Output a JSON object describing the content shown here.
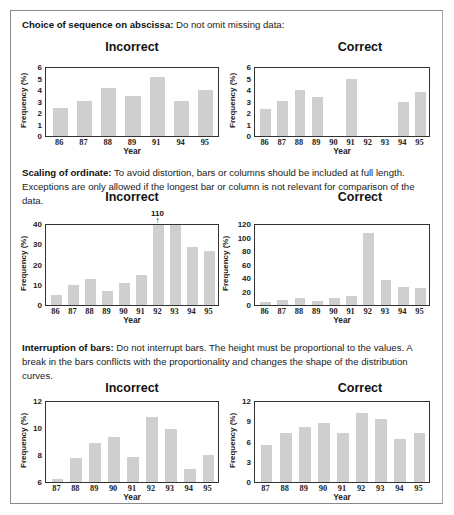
{
  "sections": [
    {
      "heading": "Choice of sequence on abscissa:",
      "text": "Do not omit missing data:"
    },
    {
      "heading": "Scaling of ordinate:",
      "text": "To avoid distortion, bars or columns should be included at full length. Exceptions are only allowed if the longest bar or column is not relevant for comparison of the data."
    },
    {
      "heading": "Interruption of bars:",
      "text": "Do not interrupt bars. The height must be proportional to the values. A break in the bars conflicts with the proportionality and changes the shape of the distribution curves."
    }
  ],
  "labels": {
    "incorrect": "Incorrect",
    "correct": "Correct",
    "xlabel": "Year",
    "ylabel": "Frequency (%)",
    "annotation_110": "110",
    "annotation_arrow": "↑"
  },
  "chart_data": [
    {
      "id": "abscissa-incorrect",
      "type": "bar",
      "title": "Incorrect",
      "xlabel": "Year",
      "ylabel": "Frequency (%)",
      "categories": [
        "86",
        "87",
        "88",
        "89",
        "91",
        "94",
        "95"
      ],
      "values": [
        2.5,
        3.1,
        4.2,
        3.5,
        5.2,
        3.1,
        4.1
      ],
      "ylim": [
        0,
        6
      ],
      "yticks": [
        "0",
        "1",
        "2",
        "3",
        "4",
        "5",
        "6"
      ],
      "grid": false
    },
    {
      "id": "abscissa-correct",
      "type": "bar",
      "title": "Correct",
      "xlabel": "Year",
      "ylabel": "Frequency (%)",
      "categories": [
        "86",
        "87",
        "88",
        "89",
        "90",
        "91",
        "92",
        "93",
        "94",
        "95"
      ],
      "values": [
        2.4,
        3.1,
        4.1,
        3.4,
        null,
        5.0,
        null,
        null,
        3.0,
        3.9
      ],
      "ylim": [
        0,
        6
      ],
      "yticks": [
        "0",
        "1",
        "2",
        "3",
        "4",
        "5",
        "6"
      ],
      "grid": false
    },
    {
      "id": "ordinate-incorrect",
      "type": "bar",
      "title": "Incorrect",
      "xlabel": "Year",
      "ylabel": "Frequency (%)",
      "categories": [
        "86",
        "87",
        "88",
        "89",
        "90",
        "91",
        "92",
        "93",
        "94",
        "95"
      ],
      "values": [
        5,
        10,
        13,
        7,
        11,
        15,
        110,
        40,
        29,
        27
      ],
      "ylim": [
        0,
        40
      ],
      "yticks": [
        "0",
        "10",
        "20",
        "30",
        "40"
      ],
      "annotations": [
        {
          "category": "92",
          "text": "110",
          "arrow": "up"
        }
      ],
      "grid": false
    },
    {
      "id": "ordinate-correct",
      "type": "bar",
      "title": "Correct",
      "xlabel": "Year",
      "ylabel": "Frequency (%)",
      "categories": [
        "86",
        "87",
        "88",
        "89",
        "90",
        "91",
        "92",
        "93",
        "94",
        "95"
      ],
      "values": [
        4,
        8,
        11,
        6,
        10,
        14,
        108,
        38,
        27,
        25
      ],
      "ylim": [
        0,
        120
      ],
      "yticks": [
        "0",
        "20",
        "40",
        "60",
        "80",
        "100",
        "120"
      ],
      "grid": false
    },
    {
      "id": "interruption-incorrect",
      "type": "bar",
      "title": "Incorrect",
      "xlabel": "Year",
      "ylabel": "Frequency (%)",
      "categories": [
        "87",
        "88",
        "89",
        "90",
        "91",
        "92",
        "93",
        "94",
        "95"
      ],
      "values": [
        6.2,
        7.8,
        8.9,
        9.4,
        7.9,
        10.9,
        10.0,
        7.0,
        8.0
      ],
      "ylim": [
        6,
        12
      ],
      "yticks": [
        "6",
        "8",
        "10",
        "12"
      ],
      "grid": false
    },
    {
      "id": "interruption-correct",
      "type": "bar",
      "title": "Correct",
      "xlabel": "Year",
      "ylabel": "Frequency (%)",
      "categories": [
        "87",
        "88",
        "89",
        "90",
        "91",
        "92",
        "93",
        "94",
        "95"
      ],
      "values": [
        5.6,
        7.4,
        8.3,
        8.8,
        7.4,
        10.4,
        9.4,
        6.4,
        7.4
      ],
      "ylim": [
        0,
        12
      ],
      "yticks": [
        "0",
        "3",
        "6",
        "9",
        "12"
      ],
      "grid": false
    }
  ]
}
